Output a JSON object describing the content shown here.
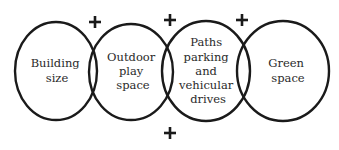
{
  "diagram": {
    "type": "overlapping-circles",
    "circles": [
      {
        "id": "building-size",
        "lines": [
          "Building",
          "size"
        ]
      },
      {
        "id": "outdoor-play-space",
        "lines": [
          "Outdoor",
          "play",
          "space"
        ]
      },
      {
        "id": "paths-parking",
        "lines": [
          "Paths",
          "parking",
          "and",
          "vehicular",
          "drives"
        ]
      },
      {
        "id": "green-space",
        "lines": [
          "Green",
          "space"
        ]
      }
    ],
    "plus_signs": [
      "+",
      "+",
      "+",
      "+"
    ],
    "colors": {
      "stroke": "#1a1a1a",
      "text": "#2a2a2a",
      "background": "#ffffff"
    }
  }
}
